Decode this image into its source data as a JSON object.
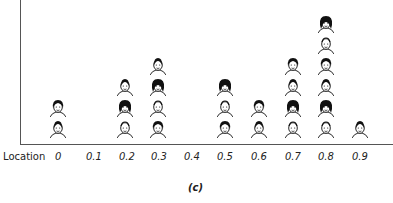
{
  "chart_data": {
    "type": "scatter",
    "subtype": "pictograph-dot-plot",
    "title": "",
    "caption": "(c)",
    "xlabel": "Location",
    "ylabel": "",
    "x_ticks": [
      "0",
      "0.1",
      "0.2",
      "0.3",
      "0.4",
      "0.5",
      "0.6",
      "0.7",
      "0.8",
      "0.9"
    ],
    "categories": [
      "0",
      "0.1",
      "0.2",
      "0.3",
      "0.4",
      "0.5",
      "0.6",
      "0.7",
      "0.8",
      "0.9"
    ],
    "values": [
      2,
      0,
      3,
      4,
      0,
      3,
      2,
      4,
      6,
      1
    ],
    "marker": "face icon (one per person)",
    "grid": false,
    "legend": null
  },
  "axis": {
    "name": "Location",
    "ticks": [
      "0",
      "0.1",
      "0.2",
      "0.3",
      "0.4",
      "0.5",
      "0.6",
      "0.7",
      "0.8",
      "0.9"
    ]
  },
  "caption": "(c)",
  "colors": {
    "ink": "#111111",
    "axis": "#555555",
    "background": "#ffffff"
  }
}
